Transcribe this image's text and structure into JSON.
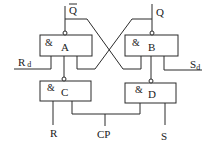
{
  "diagram": {
    "type": "logic-circuit",
    "gates": [
      {
        "id": "A",
        "symbol": "&",
        "label": "A"
      },
      {
        "id": "B",
        "symbol": "&",
        "label": "B"
      },
      {
        "id": "C",
        "symbol": "&",
        "label": "C"
      },
      {
        "id": "D",
        "symbol": "&",
        "label": "D"
      }
    ],
    "signals": {
      "q_bar": "Q",
      "q": "Q",
      "rd_main": "R",
      "rd_sub": "d",
      "sd_main": "S",
      "sd_sub": "d",
      "r": "R",
      "s": "S",
      "cp": "CP"
    }
  }
}
